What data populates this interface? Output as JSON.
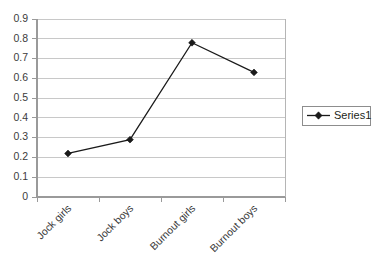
{
  "chart_data": {
    "type": "line",
    "title": "",
    "xlabel": "",
    "ylabel": "",
    "categories": [
      "Jock girls",
      "Jock boys",
      "Burnout girls",
      "Burnout boys"
    ],
    "series": [
      {
        "name": "Series1",
        "values": [
          0.22,
          0.29,
          0.78,
          0.63
        ]
      }
    ],
    "yticks": [
      "0.9",
      "0.8",
      "0.7",
      "0.6",
      "0.5",
      "0.4",
      "0.3",
      "0.2",
      "0.1",
      "0"
    ],
    "ytick_values": [
      0.9,
      0.8,
      0.7,
      0.6,
      0.5,
      0.4,
      0.3,
      0.2,
      0.1,
      0
    ],
    "ylim": [
      0,
      0.9
    ],
    "grid": "horizontal",
    "legend_position": "right",
    "marker": "diamond",
    "colors": {
      "series": "#1a1a1a",
      "gridline": "#c8c8c8",
      "axis": "#9a9a9a",
      "text": "#231f20",
      "background": "#ffffff"
    }
  },
  "legend": {
    "entries": [
      {
        "label": "Series1"
      }
    ]
  },
  "axes": {
    "y": {
      "t0": "0.9",
      "t1": "0.8",
      "t2": "0.7",
      "t3": "0.6",
      "t4": "0.5",
      "t5": "0.4",
      "t6": "0.3",
      "t7": "0.2",
      "t8": "0.1",
      "t9": "0"
    },
    "x": {
      "c0": "Jock girls",
      "c1": "Jock boys",
      "c2": "Burnout girls",
      "c3": "Burnout boys"
    }
  }
}
